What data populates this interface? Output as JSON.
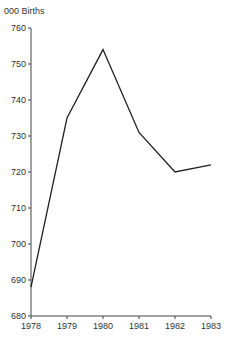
{
  "chart_data": {
    "type": "line",
    "title": "",
    "ylabel": "000 Births",
    "xlabel": "",
    "categories": [
      "1978",
      "1979",
      "1980",
      "1981",
      "1982",
      "1983"
    ],
    "series": [
      {
        "name": "Births",
        "values": [
          688,
          735,
          754,
          731,
          720,
          722
        ]
      }
    ],
    "ylim": [
      680,
      760
    ],
    "yticks": [
      680,
      690,
      700,
      710,
      720,
      730,
      740,
      750,
      760
    ],
    "grid": false,
    "legend": "none",
    "colors": {
      "line": "#222222",
      "axis": "#444444"
    }
  }
}
